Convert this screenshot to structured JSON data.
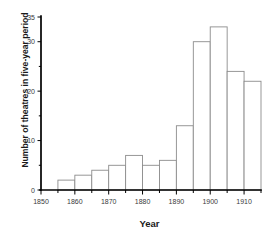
{
  "chart_data": {
    "type": "bar",
    "title": "",
    "xlabel": "Year",
    "ylabel": "Number of theatres in five-year period",
    "categories": [
      "1855",
      "1860",
      "1865",
      "1870",
      "1875",
      "1880",
      "1885",
      "1890",
      "1895",
      "1900",
      "1905",
      "1910"
    ],
    "bin_starts": [
      1855,
      1860,
      1865,
      1870,
      1875,
      1880,
      1885,
      1890,
      1895,
      1900,
      1905,
      1910
    ],
    "bin_width": 5,
    "values": [
      2,
      3,
      4,
      5,
      7,
      5,
      6,
      13,
      30,
      33,
      24,
      22
    ],
    "xlim": [
      1850,
      1915
    ],
    "ylim": [
      0,
      35
    ],
    "x_major_ticks": [
      1850,
      1860,
      1870,
      1880,
      1890,
      1900,
      1910
    ],
    "x_major_tick_labels": [
      "1850",
      "1860",
      "1870",
      "1880",
      "1890",
      "1900",
      "1910"
    ],
    "x_minor_ticks": [
      1855,
      1865,
      1875,
      1885,
      1895,
      1905,
      1915
    ],
    "y_ticks": [
      0,
      10,
      20,
      30,
      35
    ],
    "y_tick_labels": [
      "0",
      "10",
      "20",
      "30",
      "35"
    ],
    "y_minor_ticks": [
      5,
      15,
      25
    ],
    "grid": false,
    "legend": false,
    "bar_fill": "#ffffff",
    "bar_edge": "#8c8c8c",
    "axis_color": "#000000"
  }
}
